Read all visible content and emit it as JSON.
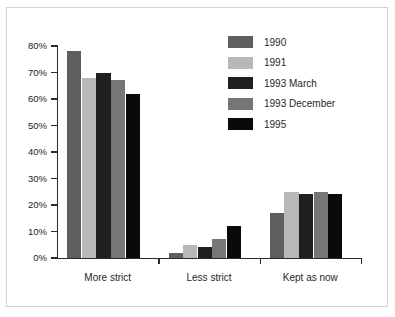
{
  "chart_data": {
    "type": "bar",
    "title": "",
    "subtitle": "",
    "xlabel": "",
    "ylabel": "",
    "categories": [
      "More strict",
      "Less strict",
      "Kept as now"
    ],
    "series": [
      {
        "name": "1990",
        "color": "#5e5e5e",
        "values": [
          78,
          2,
          17
        ]
      },
      {
        "name": "1991",
        "color": "#b8b8b8",
        "values": [
          68,
          5,
          25
        ]
      },
      {
        "name": "1993 March",
        "color": "#1f1f1f",
        "values": [
          70,
          4,
          24
        ]
      },
      {
        "name": "1993 December",
        "color": "#767676",
        "values": [
          67,
          7,
          25
        ]
      },
      {
        "name": "1995",
        "color": "#0a0a0a",
        "values": [
          62,
          12,
          24
        ]
      }
    ],
    "ylim": [
      0,
      80
    ],
    "ytick_values": [
      0,
      10,
      20,
      30,
      40,
      50,
      60,
      70,
      80
    ],
    "ytick_labels": [
      "0%",
      "10%",
      "20%",
      "30%",
      "40%",
      "50%",
      "60%",
      "70%",
      "80%"
    ],
    "grid": false,
    "legend_position": "top-right",
    "value_suffix": "%"
  },
  "legend": {
    "entries": [
      {
        "label": "1990"
      },
      {
        "label": "1991"
      },
      {
        "label": "1993 March"
      },
      {
        "label": "1993 December"
      },
      {
        "label": "1995"
      }
    ]
  },
  "axes": {
    "y_ticks": [
      "80%",
      "70%",
      "60%",
      "50%",
      "40%",
      "30%",
      "20%",
      "10%",
      "0%"
    ],
    "x_categories": [
      "More strict",
      "Less strict",
      "Kept as now"
    ]
  },
  "style": {
    "background": "#ffffff",
    "frame_border": "#d2d2d2",
    "axis_color": "#2b2b2b",
    "text_color": "#1f1f1f"
  }
}
